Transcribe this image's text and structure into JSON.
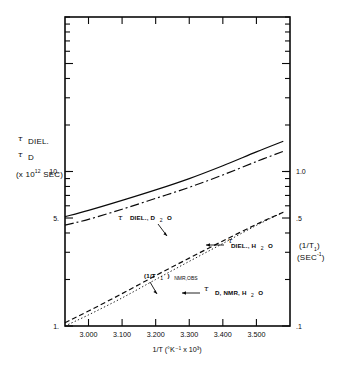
{
  "chart_data": {
    "type": "line",
    "title": "",
    "xlabel": "1/T (°K⁻¹ x 10³)",
    "ylabel_left_line1": "DIEL.",
    "ylabel_left_line2": "D",
    "ylabel_left_line3": "(x 10",
    "ylabel_left_exp": "12",
    "ylabel_left_line3b": " SEC)",
    "ylabel_right_line1": "(1/T",
    "ylabel_right_line1_sub": "1",
    "ylabel_right_line1_end": ")",
    "ylabel_right_line2": "(SEC",
    "ylabel_right_line2_sup": "-1",
    "ylabel_right_line2_end": ")",
    "x_scale": "linear",
    "y_scale": "log",
    "xlim": [
      2.93,
      3.6
    ],
    "ylim_left": [
      1.0,
      100.0
    ],
    "ylim_right": [
      0.1,
      10.0
    ],
    "grid": false,
    "legend_position": "inline-annotations",
    "x_ticks": [
      3.0,
      3.1,
      3.2,
      3.3,
      3.4,
      3.5
    ],
    "x_tick_labels": [
      "3.000",
      "3.100",
      "3.200",
      "3.300",
      "3.400",
      "3.500"
    ],
    "y_left_tick_labels": [
      {
        "value": 10.0,
        "label": "10."
      },
      {
        "value": 5.0,
        "label": "5."
      },
      {
        "value": 1.0,
        "label": "1."
      }
    ],
    "y_right_tick_labels": [
      {
        "value": 1.0,
        "label": "1.0"
      },
      {
        "value": 0.5,
        "label": ".5"
      },
      {
        "value": 0.1,
        "label": ".1"
      }
    ],
    "series": [
      {
        "name": "τ DIEL., D₂O",
        "style": "solid",
        "axis": "left",
        "x": [
          2.93,
          3.0,
          3.1,
          3.2,
          3.3,
          3.4,
          3.5,
          3.58
        ],
        "y": [
          5.1,
          5.6,
          6.5,
          7.6,
          9.0,
          10.9,
          13.4,
          15.7
        ]
      },
      {
        "name": "τ DIEL., H₂O",
        "style": "dash-dot",
        "axis": "left",
        "x": [
          2.93,
          3.0,
          3.1,
          3.2,
          3.3,
          3.4,
          3.5,
          3.58
        ],
        "y": [
          4.5,
          4.9,
          5.7,
          6.7,
          7.9,
          9.5,
          11.6,
          13.5
        ]
      },
      {
        "name": "(1/T₁) NMR,OBS",
        "style": "dashed",
        "axis": "right",
        "x": [
          2.93,
          3.0,
          3.1,
          3.2,
          3.3,
          3.4,
          3.5,
          3.58
        ],
        "y": [
          0.105,
          0.125,
          0.162,
          0.212,
          0.275,
          0.355,
          0.455,
          0.545
        ]
      },
      {
        "name": "τ D,NMR,H₂O",
        "style": "dotted",
        "axis": "right",
        "x": [
          2.93,
          3.0,
          3.1,
          3.2,
          3.3,
          3.4,
          3.5,
          3.58
        ],
        "y": [
          0.1,
          0.118,
          0.152,
          0.2,
          0.262,
          0.342,
          0.448,
          0.545
        ]
      }
    ],
    "annotations": [
      {
        "id": "ann-tau-diel-d2o",
        "tau": "τ",
        "text": "DIEL., D",
        "sub": "2",
        "text_end": "O",
        "arrow": "down-right"
      },
      {
        "id": "ann-tau-diel-h2o",
        "tau": "τ",
        "text": "DIEL., H",
        "sub": "2",
        "text_end": "O",
        "arrow": "left"
      },
      {
        "id": "ann-nmr-obs",
        "tau": "",
        "text": "(1/T",
        "sub": "1",
        "text_end": ")",
        "text_sub2": "NMR,OBS",
        "arrow": "down"
      },
      {
        "id": "ann-tau-d-nmr-h2o",
        "tau": "τ",
        "text": "D, NMR, H",
        "sub": "2",
        "text_end": "O",
        "arrow": "left"
      }
    ],
    "colors": {
      "ink": "#0a0a0a",
      "background": "#ffffff"
    }
  }
}
